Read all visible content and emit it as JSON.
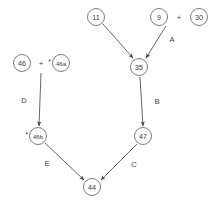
{
  "diagram": {
    "type": "directed-graph",
    "background_color": "#ffffff",
    "node_stroke_color": "#6e6e6e",
    "edge_color": "#4a4a4a",
    "text_color": "#3d3d3d",
    "nodes": [
      {
        "id": "n11",
        "label": "11",
        "cx": 96,
        "cy": 17,
        "r": 8.5,
        "prefix": ""
      },
      {
        "id": "n9",
        "label": "9",
        "cx": 159,
        "cy": 17,
        "r": 8.5,
        "prefix": ""
      },
      {
        "id": "n30",
        "label": "30",
        "cx": 199,
        "cy": 17,
        "r": 8.5,
        "prefix": ""
      },
      {
        "id": "n35",
        "label": "35",
        "cx": 139,
        "cy": 67,
        "r": 8.5,
        "prefix": ""
      },
      {
        "id": "n46",
        "label": "46",
        "cx": 22,
        "cy": 63,
        "r": 8.5,
        "prefix": ""
      },
      {
        "id": "n46a",
        "label": "46a",
        "cx": 61,
        "cy": 63,
        "r": 8.5,
        "prefix": "*"
      },
      {
        "id": "n46b",
        "label": "46b",
        "cx": 38,
        "cy": 136,
        "r": 8.5,
        "prefix": "*"
      },
      {
        "id": "n47",
        "label": "47",
        "cx": 143,
        "cy": 136,
        "r": 8.5,
        "prefix": ""
      },
      {
        "id": "n44",
        "label": "44",
        "cx": 92,
        "cy": 187,
        "r": 8.5,
        "prefix": ""
      }
    ],
    "operators": [
      {
        "id": "op-top",
        "symbol": "+",
        "x": 179,
        "y": 17
      },
      {
        "id": "op-left",
        "symbol": "+",
        "x": 41,
        "y": 63
      }
    ],
    "edges": [
      {
        "id": "e-11-35",
        "label": "",
        "from": "n11",
        "to": "n35",
        "x1": 103,
        "y1": 24,
        "x2": 133,
        "y2": 58,
        "lx": 0,
        "ly": 0
      },
      {
        "id": "e-A",
        "label": "A",
        "from": "n9",
        "to": "n35",
        "x1": 166,
        "y1": 26,
        "x2": 146,
        "y2": 58,
        "lx": 172,
        "ly": 39
      },
      {
        "id": "e-B",
        "label": "B",
        "from": "n35",
        "to": "n47",
        "x1": 140,
        "y1": 77,
        "x2": 143,
        "y2": 126,
        "lx": 157,
        "ly": 101
      },
      {
        "id": "e-D",
        "label": "D",
        "from": "n46a",
        "to": "n46b",
        "x1": 41,
        "y1": 73,
        "x2": 39,
        "y2": 126,
        "lx": 24,
        "ly": 100
      },
      {
        "id": "e-E",
        "label": "E",
        "from": "n46b",
        "to": "n44",
        "x1": 45,
        "y1": 143,
        "x2": 84,
        "y2": 180,
        "lx": 47,
        "ly": 163
      },
      {
        "id": "e-C",
        "label": "C",
        "from": "n47",
        "to": "n44",
        "x1": 137,
        "y1": 144,
        "x2": 101,
        "y2": 180,
        "lx": 134,
        "ly": 164
      }
    ]
  }
}
